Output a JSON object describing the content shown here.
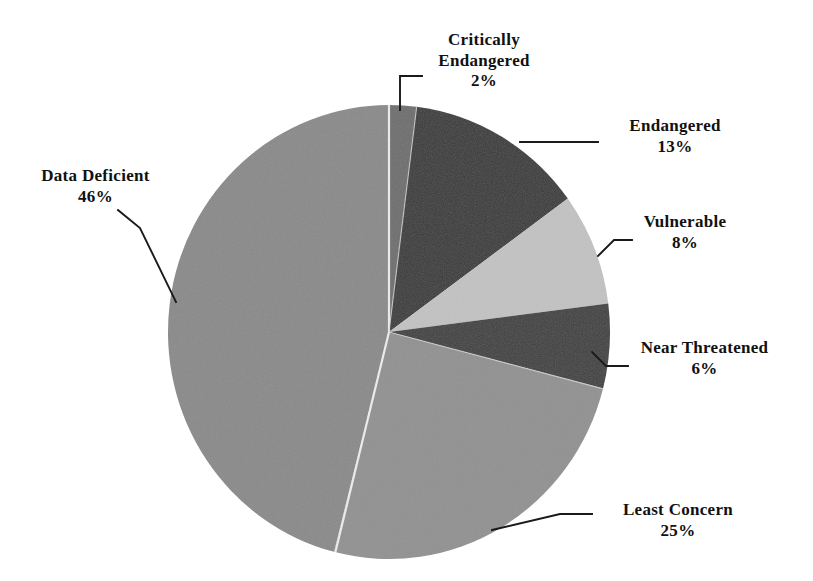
{
  "chart_data": {
    "type": "pie",
    "title": "",
    "subtitle": "",
    "xlabel": "",
    "ylabel": "",
    "legend_position": "none",
    "grid": false,
    "start_angle_deg": 0,
    "direction": "clockwise",
    "units": "percent",
    "categories": [
      "Critically Endangered",
      "Endangered",
      "Vulnerable",
      "Near Threatened",
      "Least Concern",
      "Data Deficient"
    ],
    "values": [
      2,
      13,
      8,
      6,
      25,
      46
    ],
    "value_labels": [
      "2%",
      "13%",
      "8%",
      "6%",
      "25%",
      "46%"
    ],
    "colors": [
      "#6e6e6e",
      "#3a3a3a",
      "#c2c2c2",
      "#404040",
      "#919191",
      "#8a8a8a"
    ],
    "slices": [
      {
        "name": "Critically Endangered",
        "value": 2,
        "label": "2%",
        "color": "#6e6e6e"
      },
      {
        "name": "Endangered",
        "value": 13,
        "label": "13%",
        "color": "#3a3a3a"
      },
      {
        "name": "Vulnerable",
        "value": 8,
        "label": "8%",
        "color": "#c2c2c2"
      },
      {
        "name": "Near Threatened",
        "value": 6,
        "label": "6%",
        "color": "#404040"
      },
      {
        "name": "Least Concern",
        "value": 25,
        "label": "25%",
        "color": "#919191"
      },
      {
        "name": "Data Deficient",
        "value": 46,
        "label": "46%",
        "color": "#8a8a8a"
      }
    ]
  },
  "labels": {
    "critically_endangered": {
      "line1": "Critically",
      "line2": "Endangered",
      "pct": "2%"
    },
    "endangered": {
      "name": "Endangered",
      "pct": "13%"
    },
    "vulnerable": {
      "name": "Vulnerable",
      "pct": "8%"
    },
    "near_threatened": {
      "name": "Near Threatened",
      "pct": "6%"
    },
    "least_concern": {
      "name": "Least Concern",
      "pct": "25%"
    },
    "data_deficient": {
      "name": "Data Deficient",
      "pct": "46%"
    }
  },
  "style": {
    "background": "#ffffff",
    "text_color": "#111111",
    "leader_line_color": "#1a1a1a",
    "slice_divider_color": "#f2f2f2"
  }
}
